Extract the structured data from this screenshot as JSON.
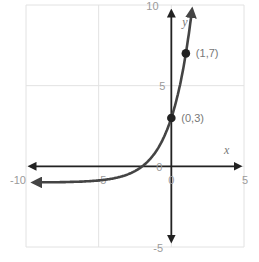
{
  "chart_data": {
    "type": "line",
    "title": "",
    "xlabel": "x",
    "ylabel": "y",
    "xlim": [
      -10,
      5
    ],
    "ylim": [
      -5,
      10
    ],
    "grid": true,
    "grid_step": 5,
    "x_ticks": [
      "-10",
      "-5",
      "0",
      "5"
    ],
    "y_ticks": [
      "-5",
      "0",
      "5",
      "10"
    ],
    "function": "y = 4*2^x - 1",
    "asymptote": -1,
    "series": [
      {
        "name": "exponential curve",
        "color": "#444444",
        "x": [
          -10,
          -8,
          -6,
          -4,
          -3,
          -2,
          -1,
          0,
          0.5,
          1,
          1.25,
          1.4
        ],
        "y": [
          -0.996,
          -0.984,
          -0.9375,
          -0.75,
          -0.5,
          0,
          1,
          3,
          4.66,
          7,
          8.51,
          9.56
        ]
      }
    ],
    "points": [
      {
        "x": 0,
        "y": 3,
        "label": "(0,3)"
      },
      {
        "x": 1,
        "y": 7,
        "label": "(1,7)"
      }
    ],
    "annotations": [
      "(0,3)",
      "(1,7)"
    ]
  }
}
